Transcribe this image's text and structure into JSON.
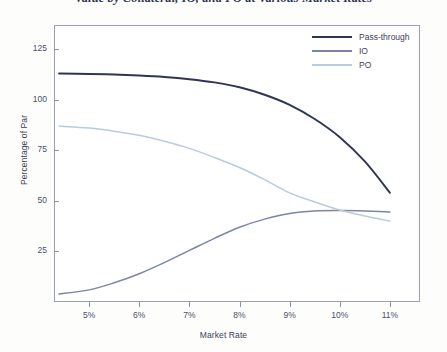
{
  "chart_data": {
    "type": "line",
    "title": "Value by Collateral, IO, and PO at Various Market Rates",
    "xlabel": "Market Rate",
    "ylabel": "Percentage of Par",
    "xlim": [
      4.3,
      11.6
    ],
    "ylim": [
      0,
      137
    ],
    "grid": false,
    "legend_position": "top-right",
    "xticks": [
      "5%",
      "6%",
      "7%",
      "8%",
      "9%",
      "10%",
      "11%"
    ],
    "xtick_values": [
      5,
      6,
      7,
      8,
      9,
      10,
      11
    ],
    "yticks": [
      "25",
      "50",
      "75",
      "100",
      "125"
    ],
    "ytick_values": [
      25,
      50,
      75,
      100,
      125
    ],
    "x": [
      4.4,
      5,
      5.5,
      6,
      6.5,
      7,
      7.5,
      8,
      8.5,
      9,
      9.5,
      10,
      10.5,
      11
    ],
    "series": [
      {
        "name": "Pass-through",
        "color": "#2e3555",
        "values": [
          113,
          112.8,
          112.5,
          112,
          111.3,
          110.2,
          108.6,
          106.2,
          102.5,
          97.5,
          90.5,
          81.5,
          69.5,
          54
        ]
      },
      {
        "name": "IO",
        "color": "#7b85a8",
        "values": [
          4,
          6,
          9.5,
          14,
          19.5,
          25.5,
          31.5,
          37,
          41,
          43.8,
          45,
          45.2,
          45,
          44.5
        ]
      },
      {
        "name": "PO",
        "color": "#b8cbdf",
        "values": [
          87,
          86,
          84.5,
          82.5,
          79.5,
          76,
          71.5,
          66.5,
          60.5,
          54,
          49.5,
          45.5,
          42.5,
          40
        ]
      }
    ]
  }
}
